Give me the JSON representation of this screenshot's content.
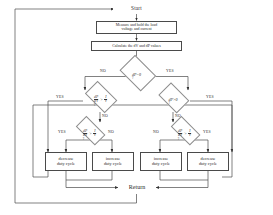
{
  "diagram": {
    "type": "flowchart",
    "nodes": {
      "start": {
        "label": "Start"
      },
      "measure": {
        "line1": "Measure and  hold the load",
        "line2": "voltage and current"
      },
      "calculate": {
        "text": "Calculate the dV and dP values"
      },
      "d1": {
        "label": "dP=0",
        "query": "?"
      },
      "d2_left": {
        "num": "dP",
        "den": "dV",
        "rel": ">",
        "rnum": "I",
        "rden": "V",
        "query": "?"
      },
      "d2_right": {
        "label": "dP>0",
        "query": "?"
      },
      "d3_left": {
        "num": "dP",
        "den": "dV",
        "rel": ">",
        "rnum": "I",
        "rden": "V",
        "query": "?"
      },
      "d3_right": {
        "num": "dP",
        "den": "dV",
        "rel": ">",
        "rnum": "I",
        "rden": "V",
        "query": "?"
      },
      "act1": {
        "line1": "decrease",
        "line2": "duty cycle"
      },
      "act2": {
        "line1": "increase",
        "line2": "duty cycle"
      },
      "act3": {
        "line1": "increase",
        "line2": "duty cycle"
      },
      "act4": {
        "line1": "decrease",
        "line2": "duty cycle"
      },
      "return": {
        "label": "Return"
      }
    },
    "edge_labels": {
      "d1_no": "NO",
      "d1_yes": "YES",
      "d2l_yes": "YES",
      "d2r_yes": "YES",
      "d2r_no": "NO",
      "d2l_no": "NO",
      "d3l_yes": "YES",
      "d3l_no": "NO",
      "d3r_no": "NO",
      "d3r_yes": "YES"
    },
    "colors": {
      "stroke": "#4a4a4a",
      "diamond_stroke": "#8d8d8d",
      "text": "#2a2a2a",
      "background": "#ffffff"
    }
  }
}
